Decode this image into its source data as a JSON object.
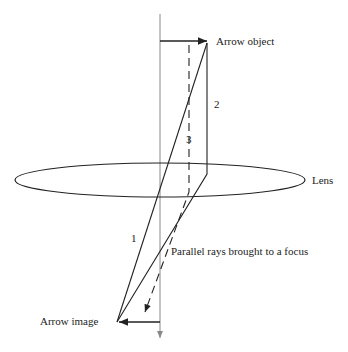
{
  "diagram": {
    "type": "optics-lens-ray-diagram",
    "labels": {
      "arrow_object": "Arrow object",
      "arrow_image": "Arrow image",
      "lens": "Lens",
      "focus_note": "Parallel rays brought to a focus"
    },
    "ray_numbers": {
      "ray1": "1",
      "ray2": "2",
      "ray3": "3"
    },
    "colors": {
      "line": "#222222",
      "axis": "#888888",
      "background": "#ffffff"
    }
  }
}
